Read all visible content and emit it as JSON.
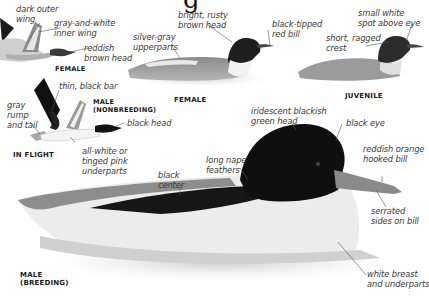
{
  "title_fragment": "g",
  "figures": {
    "female_flight": {
      "caption": "FEMALE",
      "labels": {
        "outer_wing": "dark outer\nwing",
        "inner_wing": "gray-and-white\ninner wing",
        "head": "reddish\nbrown head"
      }
    },
    "male_nonbreeding_flight": {
      "caption": "MALE\n(NONBREEDING)",
      "labels": {
        "wing_bar": "thin, black bar",
        "rump": "gray\nrump\nand tail",
        "head": "black head",
        "underparts": "all-white or\ntinged pink\nunderparts"
      }
    },
    "in_flight_caption": "IN FLIGHT",
    "female_swimming": {
      "caption": "FEMALE",
      "labels": {
        "head": "bright, rusty\nbrown head",
        "bill": "black-tipped\nred bill",
        "upperparts": "silver-gray\nupperparts"
      }
    },
    "juvenile": {
      "caption": "JUVENILE",
      "labels": {
        "eye_spot": "small white\nspot above eye",
        "crest": "short, ragged\ncrest"
      }
    },
    "male_breeding": {
      "caption": "MALE\n(BREEDING)",
      "labels": {
        "head": "iridescent blackish\ngreen head",
        "eye": "black eye",
        "bill": "reddish orange\nhooked bill",
        "bill_sides": "serrated\nsides on bill",
        "nape": "long nape\nfeathers",
        "center": "black\ncenter",
        "breast": "white breast\nand underparts"
      }
    }
  },
  "colors": {
    "background": "#ffffff",
    "label_text": "#3a3a3a",
    "caption_text": "#1a1a1a",
    "leader_line": "#555555"
  }
}
